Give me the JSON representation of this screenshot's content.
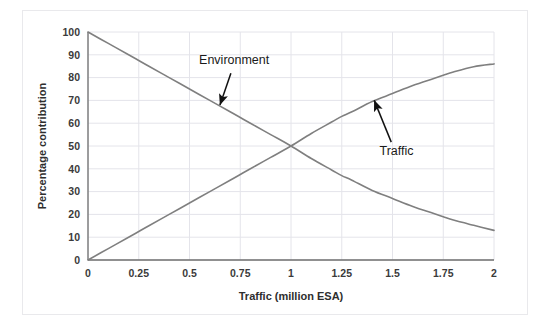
{
  "figure": {
    "background_color": "#ffffff",
    "frame_color": "#e9e9ec",
    "plot_area": {
      "left": 88,
      "top": 32,
      "right": 494,
      "bottom": 260
    }
  },
  "chart_data": {
    "type": "line",
    "title": "",
    "subtitle": "",
    "xlabel": "Traffic (million ESA)",
    "ylabel": "Percentage contribution",
    "xlim": [
      0,
      2
    ],
    "ylim": [
      0,
      100
    ],
    "xticks": [
      0,
      0.25,
      0.5,
      0.75,
      1,
      1.25,
      1.5,
      1.75,
      2
    ],
    "xtick_labels": [
      "0",
      "0.25",
      "0.5",
      "0.75",
      "1",
      "1.25",
      "1.5",
      "1.75",
      "2"
    ],
    "yticks": [
      0,
      10,
      20,
      30,
      40,
      50,
      60,
      70,
      80,
      90,
      100
    ],
    "ytick_labels": [
      "0",
      "10",
      "20",
      "30",
      "40",
      "50",
      "60",
      "70",
      "80",
      "90",
      "100"
    ],
    "grid": true,
    "grid_color": "#e4e4ea",
    "grid_axes": "both",
    "legend": "none (curves labelled by arrow annotations)",
    "line_color": "#7f7f7f",
    "line_width": 1.6,
    "x": [
      0,
      0.1,
      0.2,
      0.25,
      0.3,
      0.4,
      0.5,
      0.6,
      0.7,
      0.75,
      0.8,
      0.9,
      1,
      1.1,
      1.2,
      1.25,
      1.3,
      1.4,
      1.5,
      1.6,
      1.7,
      1.75,
      1.8,
      1.9,
      2
    ],
    "series": [
      {
        "name": "Environment",
        "values": [
          100,
          95,
          90,
          87.5,
          85,
          80,
          75,
          70,
          65,
          62.5,
          60,
          55,
          50,
          44.5,
          39.5,
          37,
          35,
          30.5,
          27,
          23.5,
          20.5,
          19,
          17.5,
          15.2,
          13
        ]
      },
      {
        "name": "Traffic",
        "values": [
          0,
          5,
          10,
          12.5,
          15,
          20,
          25,
          30,
          35,
          37.5,
          40,
          45,
          50,
          55.5,
          60.5,
          63,
          65,
          69.5,
          73,
          76.5,
          79.5,
          81,
          82.5,
          84.8,
          86
        ]
      }
    ],
    "annotations": [
      {
        "label": "Environment",
        "label_x": 0.72,
        "label_y": 86,
        "arrow_tip_x": 0.65,
        "arrow_tip_y": 68,
        "color": "#111111"
      },
      {
        "label": "Traffic",
        "label_x": 1.52,
        "label_y": 46,
        "arrow_tip_x": 1.41,
        "arrow_tip_y": 70,
        "color": "#111111"
      }
    ],
    "crossing_point": {
      "x": 1,
      "y": 50
    }
  }
}
